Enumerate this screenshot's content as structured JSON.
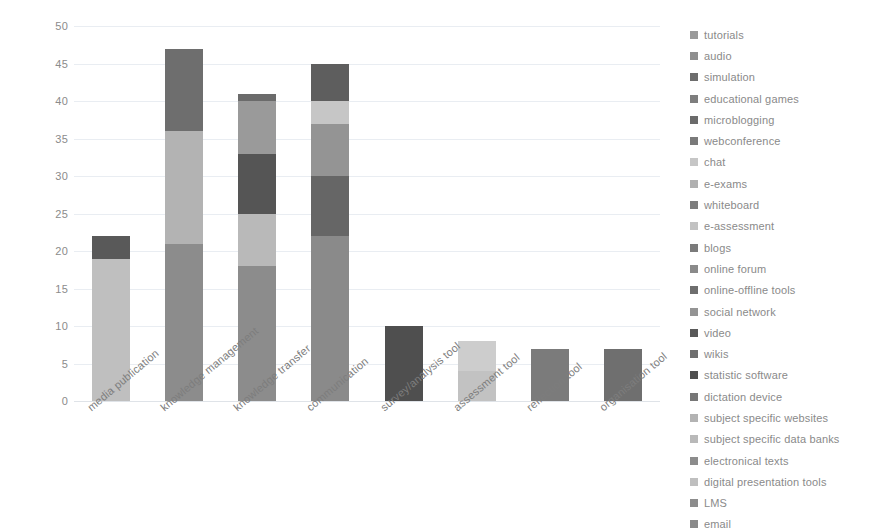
{
  "chart_data": {
    "type": "bar",
    "title": "",
    "subtitle": "",
    "xlabel": "",
    "ylabel": "",
    "ylim": [
      0,
      50
    ],
    "ytick_step": 5,
    "yticks": [
      0,
      5,
      10,
      15,
      20,
      25,
      30,
      35,
      40,
      45,
      50
    ],
    "grid": true,
    "stacked": true,
    "legend_position": "right",
    "categories": [
      "media publication",
      "knowledge management",
      "knowledge transfer",
      "communication",
      "survey/analysis tool",
      "assessment tool",
      "reflection tool",
      "organisation tool"
    ],
    "totals": [
      22,
      47,
      41,
      45,
      10,
      8,
      7,
      7
    ],
    "bars": [
      {
        "category": "media publication",
        "total": 22,
        "segments": [
          {
            "label": "digital presentation tools",
            "value": 19,
            "color": "#bfbfbf"
          },
          {
            "label": "video",
            "value": 3,
            "color": "#595959"
          }
        ]
      },
      {
        "category": "knowledge management",
        "total": 47,
        "segments": [
          {
            "label": "LMS",
            "value": 21,
            "color": "#8c8c8c"
          },
          {
            "label": "subject specific websites",
            "value": 15,
            "color": "#b3b3b3"
          },
          {
            "label": "online-offline tools",
            "value": 11,
            "color": "#6e6e6e"
          }
        ]
      },
      {
        "category": "knowledge transfer",
        "total": 41,
        "segments": [
          {
            "label": "electronical texts",
            "value": 18,
            "color": "#8c8c8c"
          },
          {
            "label": "subject specific data banks",
            "value": 7,
            "color": "#b9b9b9"
          },
          {
            "label": "simulation",
            "value": 8,
            "color": "#555555"
          },
          {
            "label": "tutorials",
            "value": 7,
            "color": "#9a9a9a"
          },
          {
            "label": "educational games",
            "value": 1,
            "color": "#6b6b6b"
          }
        ]
      },
      {
        "category": "communication",
        "total": 45,
        "segments": [
          {
            "label": "email",
            "value": 22,
            "color": "#8a8a8a"
          },
          {
            "label": "online forum",
            "value": 8,
            "color": "#666666"
          },
          {
            "label": "social network",
            "value": 7,
            "color": "#949494"
          },
          {
            "label": "chat",
            "value": 3,
            "color": "#c6c6c6"
          },
          {
            "label": "webconference",
            "value": 5,
            "color": "#5e5e5e"
          }
        ]
      },
      {
        "category": "survey/analysis tool",
        "total": 10,
        "segments": [
          {
            "label": "statistic software",
            "value": 10,
            "color": "#4f4f4f"
          }
        ]
      },
      {
        "category": "assessment tool",
        "total": 8,
        "segments": [
          {
            "label": "e-assessment",
            "value": 4,
            "color": "#c2c2c2"
          },
          {
            "label": "e-exams",
            "value": 4,
            "color": "#cdcdcd"
          }
        ]
      },
      {
        "category": "reflection tool",
        "total": 7,
        "segments": [
          {
            "label": "blogs",
            "value": 7,
            "color": "#7b7b7b"
          }
        ]
      },
      {
        "category": "organisation tool",
        "total": 7,
        "segments": [
          {
            "label": "wikis",
            "value": 7,
            "color": "#6f6f6f"
          }
        ]
      }
    ],
    "legend": [
      {
        "label": "tutorials",
        "color": "#9a9a9a"
      },
      {
        "label": "audio",
        "color": "#8f8f8f"
      },
      {
        "label": "simulation",
        "color": "#6d6d6d"
      },
      {
        "label": "educational games",
        "color": "#7e7e7e"
      },
      {
        "label": "microblogging",
        "color": "#6b6b6b"
      },
      {
        "label": "webconference",
        "color": "#7a7a7a"
      },
      {
        "label": "chat",
        "color": "#c6c6c6"
      },
      {
        "label": "e-exams",
        "color": "#b0b0b0"
      },
      {
        "label": "whiteboard",
        "color": "#7d7d7d"
      },
      {
        "label": "e-assessment",
        "color": "#c2c2c2"
      },
      {
        "label": "blogs",
        "color": "#7b7b7b"
      },
      {
        "label": "online forum",
        "color": "#8a8a8a"
      },
      {
        "label": "online-offline tools",
        "color": "#6e6e6e"
      },
      {
        "label": "social network",
        "color": "#949494"
      },
      {
        "label": "video",
        "color": "#595959"
      },
      {
        "label": "wikis",
        "color": "#6f6f6f"
      },
      {
        "label": "statistic software",
        "color": "#4f4f4f"
      },
      {
        "label": "dictation device",
        "color": "#777777"
      },
      {
        "label": "subject specific websites",
        "color": "#b3b3b3"
      },
      {
        "label": "subject specific data banks",
        "color": "#b9b9b9"
      },
      {
        "label": "electronical texts",
        "color": "#8c8c8c"
      },
      {
        "label": "digital presentation tools",
        "color": "#bfbfbf"
      },
      {
        "label": "LMS",
        "color": "#8c8c8c"
      },
      {
        "label": "email",
        "color": "#8a8a8a"
      }
    ]
  }
}
